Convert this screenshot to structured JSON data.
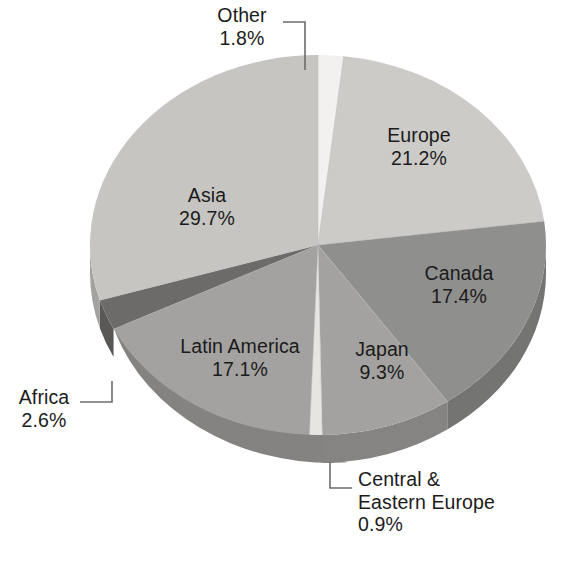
{
  "chart_data": {
    "type": "pie",
    "title": "",
    "subtitle": "",
    "xlabel": "",
    "ylabel": "",
    "grid": false,
    "legend_position": "none",
    "labels_mode": "callout-and-inside",
    "units": "percent",
    "categories": [
      "Other",
      "Europe",
      "Canada",
      "Japan",
      "Central & Eastern Europe",
      "Latin America",
      "Africa",
      "Asia"
    ],
    "values": [
      1.8,
      21.2,
      17.4,
      9.3,
      0.9,
      17.1,
      2.6,
      29.7
    ],
    "value_labels": [
      "1.8%",
      "21.2%",
      "17.4%",
      "9.3%",
      "0.9%",
      "17.1%",
      "2.6%",
      "29.7%"
    ],
    "slices": [
      {
        "name": "Other",
        "value": 1.8,
        "value_label": "1.8%",
        "color": "#f2f1ef",
        "side_color": "#cfcdca",
        "label_placement": "callout-top"
      },
      {
        "name": "Europe",
        "value": 21.2,
        "value_label": "21.2%",
        "color": "#cccbc8",
        "side_color": "#a8a7a4",
        "label_placement": "inside"
      },
      {
        "name": "Canada",
        "value": 17.4,
        "value_label": "17.4%",
        "color": "#8f8f8e",
        "side_color": "#747473",
        "label_placement": "inside"
      },
      {
        "name": "Japan",
        "value": 9.3,
        "value_label": "9.3%",
        "color": "#a3a2a0",
        "side_color": "#858482",
        "label_placement": "inside"
      },
      {
        "name": "Central & Eastern Europe",
        "value": 0.9,
        "value_label": "0.9%",
        "color": "#e6e5e2",
        "side_color": "#c3c2bf",
        "label_placement": "callout-bottom"
      },
      {
        "name": "Latin America",
        "value": 17.1,
        "value_label": "17.1%",
        "color": "#a3a2a0",
        "side_color": "#848381",
        "label_placement": "inside"
      },
      {
        "name": "Africa",
        "value": 2.6,
        "value_label": "2.6%",
        "color": "#6c6b6a",
        "side_color": "#595857",
        "label_placement": "callout-left"
      },
      {
        "name": "Asia",
        "value": 29.7,
        "value_label": "29.7%",
        "color": "#c6c5c2",
        "side_color": "#a3a2a0",
        "label_placement": "inside"
      }
    ],
    "total": 100.0
  },
  "labels": {
    "other": {
      "name": "Other",
      "value": "1.8%"
    },
    "europe": {
      "name": "Europe",
      "value": "21.2%"
    },
    "canada": {
      "name": "Canada",
      "value": "17.4%"
    },
    "japan": {
      "name": "Japan",
      "value": "9.3%"
    },
    "latin": {
      "name": "Latin America",
      "value": "17.1%"
    },
    "asia": {
      "name": "Asia",
      "value": "29.7%"
    },
    "africa": {
      "name": "Africa",
      "value": "2.6%"
    },
    "cee": {
      "name_line1": "Central &",
      "name_line2": "Eastern Europe",
      "value": "0.9%"
    }
  }
}
